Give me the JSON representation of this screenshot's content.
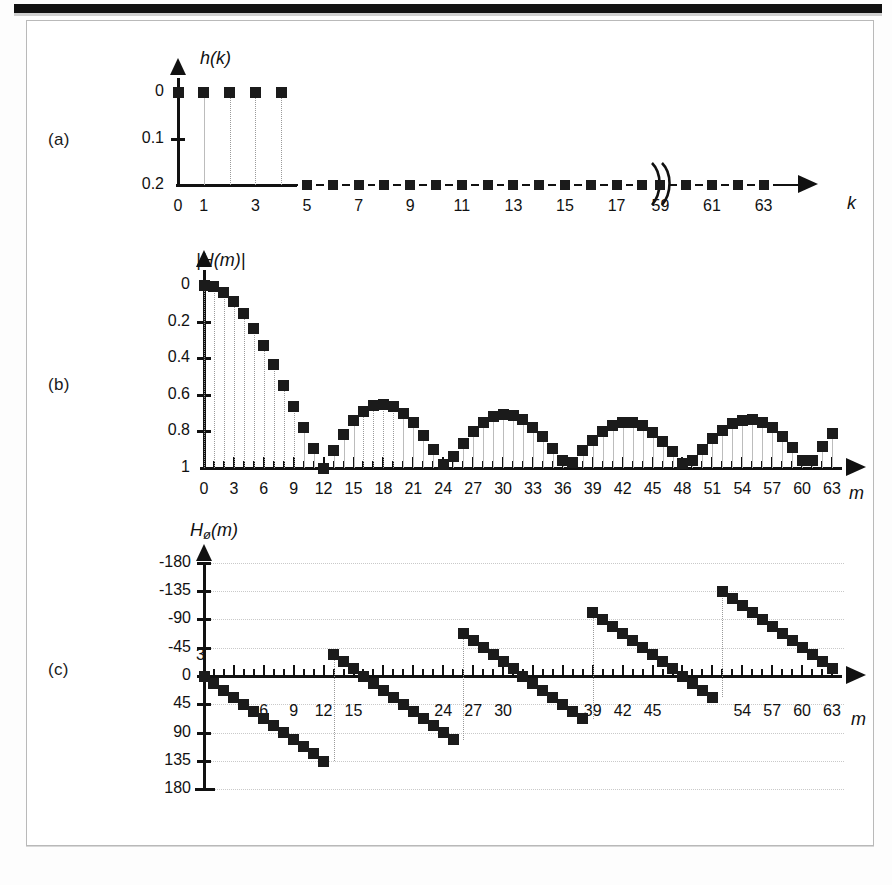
{
  "figure": {
    "panels": [
      "(a)",
      "(b)",
      "(c)"
    ]
  },
  "panel_a": {
    "label": "(a)",
    "ylabel": "h(k)",
    "xlabel": "k",
    "yticks": [
      "0.2",
      "0.1",
      "0"
    ],
    "xticks": [
      "0",
      "1",
      "3",
      "5",
      "7",
      "9",
      "11",
      "13",
      "15",
      "17",
      "59",
      "61",
      "63"
    ],
    "axis_break": true
  },
  "panel_b": {
    "label": "(b)",
    "ylabel": "|H(m)|",
    "xlabel": "m",
    "yticks": [
      "1",
      "0.8",
      "0.6",
      "0.4",
      "0.2",
      "0"
    ],
    "xticks": [
      "0",
      "3",
      "6",
      "9",
      "12",
      "15",
      "18",
      "21",
      "24",
      "27",
      "30",
      "33",
      "36",
      "39",
      "42",
      "45",
      "48",
      "51",
      "54",
      "57",
      "60",
      "63"
    ]
  },
  "panel_c": {
    "label": "(c)",
    "ylabel": "Hø(m)",
    "xlabel": "m",
    "annotation": "3",
    "yticks": [
      "180",
      "135",
      "90",
      "45",
      "0",
      "–45",
      "–90",
      "–135",
      "–180"
    ],
    "xticks": [
      "6",
      "9",
      "12",
      "15",
      "24",
      "27",
      "30",
      "39",
      "42",
      "45",
      "54",
      "57",
      "60",
      "63"
    ]
  },
  "colors": {
    "marker": "#1b1b1b",
    "axis": "#111111",
    "stem": "#9a9a9a",
    "grid": "#c9c9c9",
    "frame": "#b9b9b9",
    "topbar": "#111111",
    "background": "#ffffff"
  },
  "chart_data": [
    {
      "type": "scatter",
      "id": "panel_a",
      "title": "h(k)",
      "xlabel": "k",
      "ylabel": "h(k)",
      "xlim": [
        0,
        63
      ],
      "ylim": [
        0,
        0.2
      ],
      "yticks": [
        0,
        0.1,
        0.2
      ],
      "xticks": [
        0,
        1,
        3,
        5,
        7,
        9,
        11,
        13,
        15,
        17,
        59,
        61,
        63
      ],
      "grid": false,
      "axis_break_between": [
        18,
        58
      ],
      "x": [
        0,
        1,
        2,
        3,
        4,
        5,
        6,
        7,
        8,
        9,
        10,
        11,
        12,
        13,
        14,
        15,
        16,
        17,
        18,
        59,
        60,
        61,
        62,
        63
      ],
      "values": [
        0.2,
        0.2,
        0.2,
        0.2,
        0.2,
        0,
        0,
        0,
        0,
        0,
        0,
        0,
        0,
        0,
        0,
        0,
        0,
        0,
        0,
        0,
        0,
        0,
        0,
        0
      ]
    },
    {
      "type": "scatter",
      "id": "panel_b",
      "title": "|H(m)|",
      "xlabel": "m",
      "ylabel": "|H(m)|",
      "xlim": [
        0,
        63
      ],
      "ylim": [
        0,
        1
      ],
      "yticks": [
        0,
        0.2,
        0.4,
        0.6,
        0.8,
        1
      ],
      "xticks": [
        0,
        3,
        6,
        9,
        12,
        15,
        18,
        21,
        24,
        27,
        30,
        33,
        36,
        39,
        42,
        45,
        48,
        51,
        54,
        57,
        60,
        63
      ],
      "grid": false,
      "x": [
        0,
        1,
        2,
        3,
        4,
        5,
        6,
        7,
        8,
        9,
        10,
        11,
        12,
        13,
        14,
        15,
        16,
        17,
        18,
        19,
        20,
        21,
        22,
        23,
        24,
        25,
        26,
        27,
        28,
        29,
        30,
        31,
        32,
        33,
        34,
        35,
        36,
        37,
        38,
        39,
        40,
        41,
        42,
        43,
        44,
        45,
        46,
        47,
        48,
        49,
        50,
        51,
        52,
        53,
        54,
        55,
        56,
        57,
        58,
        59,
        60,
        61,
        62,
        63
      ],
      "values": [
        1.0,
        0.99,
        0.961,
        0.912,
        0.846,
        0.764,
        0.67,
        0.565,
        0.453,
        0.337,
        0.221,
        0.107,
        0.0,
        0.098,
        0.185,
        0.257,
        0.309,
        0.34,
        0.348,
        0.334,
        0.299,
        0.246,
        0.179,
        0.102,
        0.021,
        0.061,
        0.136,
        0.2,
        0.249,
        0.281,
        0.294,
        0.288,
        0.264,
        0.224,
        0.17,
        0.107,
        0.039,
        0.03,
        0.095,
        0.153,
        0.2,
        0.233,
        0.249,
        0.248,
        0.23,
        0.195,
        0.147,
        0.088,
        0.024,
        0.041,
        0.103,
        0.159,
        0.206,
        0.241,
        0.261,
        0.265,
        0.251,
        0.22,
        0.172,
        0.11,
        0.039,
        0.039,
        0.115,
        0.19
      ],
      "note": "|H(m)| = |sin(5*pi*m/64)/(5*sin(pi*m/64))| for a 5-tap moving average, 64-point DFT; plotted curve normalized so H(0)=1"
    },
    {
      "type": "scatter",
      "id": "panel_c",
      "title": "Hø(m)",
      "xlabel": "m",
      "ylabel": "Hø(m)",
      "xlim": [
        0,
        63
      ],
      "ylim": [
        -180,
        180
      ],
      "yticks": [
        -180,
        -135,
        -90,
        -45,
        0,
        45,
        90,
        135,
        180
      ],
      "xticks": [
        6,
        9,
        12,
        15,
        24,
        27,
        30,
        39,
        42,
        45,
        54,
        57,
        60,
        63
      ],
      "grid": true,
      "x": [
        0,
        1,
        2,
        3,
        4,
        5,
        6,
        7,
        8,
        9,
        10,
        11,
        12,
        13,
        14,
        15,
        16,
        17,
        18,
        19,
        20,
        21,
        22,
        23,
        24,
        25,
        26,
        27,
        28,
        29,
        30,
        31,
        32,
        33,
        34,
        35,
        36,
        37,
        38,
        39,
        40,
        41,
        42,
        43,
        44,
        45,
        46,
        47,
        48,
        49,
        50,
        51,
        52,
        53,
        54,
        55,
        56,
        57,
        58,
        59,
        60,
        61,
        62,
        63
      ],
      "values": [
        0,
        -11.25,
        -22.5,
        -33.75,
        -45,
        -56.25,
        -67.5,
        -78.75,
        -90,
        -101.25,
        -112.5,
        -123.75,
        -135,
        33.75,
        22.5,
        11.25,
        0,
        -11.25,
        -22.5,
        -33.75,
        -45,
        -56.25,
        -67.5,
        -78.75,
        -90,
        -101.25,
        67.5,
        56.25,
        45,
        33.75,
        22.5,
        11.25,
        0,
        -11.25,
        -22.5,
        -33.75,
        -45,
        -56.25,
        -67.5,
        101.25,
        90,
        78.75,
        67.5,
        56.25,
        45,
        33.75,
        22.5,
        11.25,
        0,
        -11.25,
        -22.5,
        -33.75,
        135,
        123.75,
        112.5,
        101.25,
        90,
        78.75,
        67.5,
        56.25,
        45,
        33.75,
        22.5,
        11.25
      ],
      "note": "wrapped linear phase, slope -11.25 deg per bin, with 180-deg flips at each |H| null"
    }
  ]
}
